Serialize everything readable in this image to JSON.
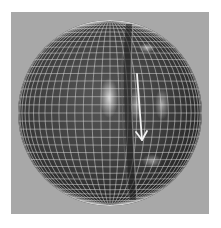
{
  "figure": {
    "description": "3D rendered sphere with wireframe grid, a vertical crease/deformation groove and a white downward arrow",
    "background_color": "#a8a8a8",
    "sphere_color": "#3c3c3c",
    "grid_color": "#d8d8d8",
    "arrow_color": "#f2f2f2",
    "sphere": {
      "cx": 110,
      "cy": 113,
      "rx": 92,
      "ry": 93
    },
    "arrow": {
      "x1": 137,
      "y1": 74,
      "x2": 142,
      "y2": 140
    },
    "highlights": [
      {
        "cx": 109,
        "cy": 98,
        "rx": 9,
        "ry": 20,
        "opacity": 0.75
      },
      {
        "cx": 136,
        "cy": 105,
        "rx": 6,
        "ry": 16,
        "opacity": 0.45
      },
      {
        "cx": 162,
        "cy": 104,
        "rx": 7,
        "ry": 16,
        "opacity": 0.5
      },
      {
        "cx": 147,
        "cy": 48,
        "rx": 8,
        "ry": 5,
        "opacity": 0.55
      },
      {
        "cx": 152,
        "cy": 161,
        "rx": 10,
        "ry": 7,
        "opacity": 0.45
      }
    ]
  }
}
